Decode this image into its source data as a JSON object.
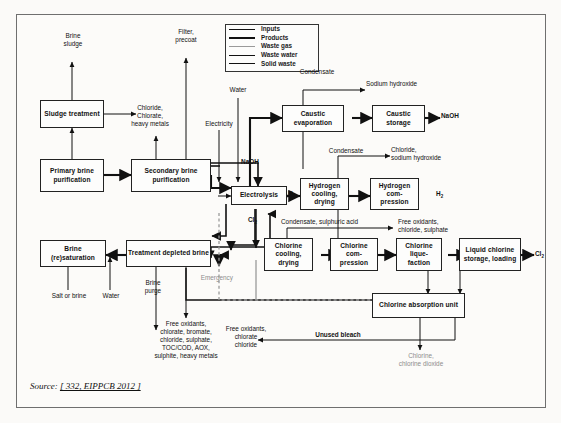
{
  "figure": {
    "source_prefix": "Source:",
    "source_ref": "[ 332, EIPPCB 2012 ]"
  },
  "legend": {
    "items": [
      {
        "label": "Inputs",
        "color": "#111111",
        "weight": "thin"
      },
      {
        "label": "Products",
        "color": "#111111",
        "weight": "thick"
      },
      {
        "label": "Waste gas",
        "color": "#9a9a9a",
        "weight": "thin"
      },
      {
        "label": "Waste water",
        "color": "#111111",
        "weight": "medium"
      },
      {
        "label": "Solid waste",
        "color": "#111111",
        "weight": "thin"
      }
    ]
  },
  "nodes": [
    {
      "id": "sludge-treatment",
      "label": "Sludge\ntreatment"
    },
    {
      "id": "primary-brine-purification",
      "label": "Primary\nbrine\npurification"
    },
    {
      "id": "secondary-brine-purification",
      "label": "Secondary\nbrine\npurification"
    },
    {
      "id": "brine-resaturation",
      "label": "Brine\n(re)saturation"
    },
    {
      "id": "treatment-depleted-brine",
      "label": "Treatment\ndepleted brine"
    },
    {
      "id": "electrolysis",
      "label": "Electrolysis"
    },
    {
      "id": "caustic-evaporation",
      "label": "Caustic\nevaporation"
    },
    {
      "id": "caustic-storage",
      "label": "Caustic\nstorage"
    },
    {
      "id": "hydrogen-cooling-drying",
      "label": "Hydrogen\ncooling,\ndrying"
    },
    {
      "id": "hydrogen-compression",
      "label": "Hydrogen\ncom-\npression"
    },
    {
      "id": "chlorine-cooling-drying",
      "label": "Chlorine\ncooling,\ndrying"
    },
    {
      "id": "chlorine-compression",
      "label": "Chlorine\ncom-\npression"
    },
    {
      "id": "chlorine-liquefaction",
      "label": "Chlorine\nlique-\nfaction"
    },
    {
      "id": "liquid-chlorine-storage-loading",
      "label": "Liquid chlorine\nstorage,\nloading"
    },
    {
      "id": "chlorine-absorption-unit",
      "label": "Chlorine absorption\nunit"
    }
  ],
  "labels": {
    "brine_sludge": "Brine\nsludge",
    "filter_precoat": "Filter,\nprecoat",
    "chloride_chlorate_heavy_metals": "Chloride,\nChlorate,\nheavy metals",
    "water_top": "Water",
    "electricity": "Electricity",
    "naoh_input": "NaOH",
    "salt_or_brine": "Salt or brine",
    "water_left": "Water",
    "brine_purge": "Brine\npurge",
    "brine_waste_list": "Free oxidants,\nchlorate, bromate,\nchloride, sulphate,\nTOC/COD, AOX,\nsulphite, heavy metals",
    "condensate_caustic": "Condensate",
    "sodium_hydroxide": "Sodium hydroxide",
    "naoh_product": "NaOH",
    "condensate_hydrogen": "Condensate",
    "chloride_sodium_hydroxide": "Chloride,\nsodium hydroxide",
    "h2_electrolysis": "H",
    "h2_electrolysis_sub": "2",
    "h2_product": "H",
    "h2_product_sub": "2",
    "cl2_electrolysis": "Cl",
    "cl2_electrolysis_sub": "2",
    "condensate_sulphuric_acid": "Condensate, sulphuric acid",
    "free_oxidants_chloride_sulphate": "Free oxidants,\nchloride, sulphate",
    "cl2_product": "Cl",
    "cl2_product_sub": "2",
    "emergency": "Emergency",
    "unused_bleach": "Unused bleach",
    "free_oxidants_chlorate_chloride": "Free oxidants,\nchlorate\nchloride",
    "chlorine_chlorine_dioxide": "Chlorine,\nchlorine dioxide"
  },
  "colors": {
    "line": "#111111",
    "waste_gas_line": "#9a9a9a",
    "gray_text": "#8d8d8d",
    "node_border": "#222222",
    "frame": "#6f6f6f"
  }
}
